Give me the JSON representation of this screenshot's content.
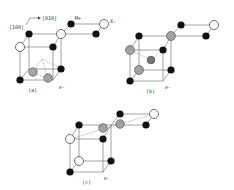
{
  "figure": {
    "axis_labels": {
      "x": "[010]",
      "z": "[100]"
    },
    "ion_labels": {
      "cation": "M+",
      "anion": "X-"
    },
    "electron_label": "e-",
    "panels": [
      {
        "id": "a",
        "caption": "(a)"
      },
      {
        "id": "b",
        "caption": "(b)"
      },
      {
        "id": "c",
        "caption": "(c)"
      }
    ]
  },
  "colors": {
    "cation": "#111111",
    "anion_fill": "#ffffff",
    "anion_stroke": "#333333",
    "hatched": "#888888",
    "line": "#666666"
  }
}
